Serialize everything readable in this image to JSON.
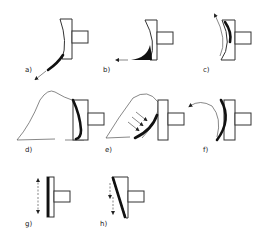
{
  "figure": {
    "panels": [
      {
        "id": "a",
        "label": "a)"
      },
      {
        "id": "b",
        "label": "b)"
      },
      {
        "id": "c",
        "label": "c)"
      },
      {
        "id": "d",
        "label": "d)"
      },
      {
        "id": "e",
        "label": "e)"
      },
      {
        "id": "f",
        "label": "f)"
      },
      {
        "id": "g",
        "label": "g)"
      },
      {
        "id": "h",
        "label": "h)"
      }
    ]
  },
  "colors": {
    "background": "#ffffff",
    "line": "#333333",
    "fill_dark": "#111111"
  }
}
